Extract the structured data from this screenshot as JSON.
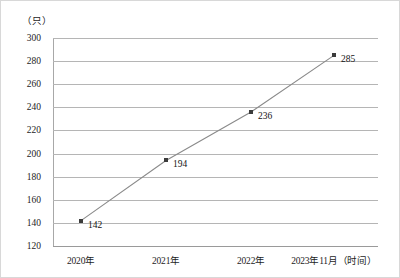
{
  "chart_data": {
    "type": "line",
    "title": "",
    "subtitle": "",
    "xlabel": "时间",
    "ylabel": "只",
    "y_unit_caption": "（只）",
    "x_axis_caption": "（时间）",
    "categories": [
      "2020年",
      "2021年",
      "2022年",
      "2023年11月"
    ],
    "x_tick_labels": [
      "2020年",
      "2021年",
      "2022年",
      "2023年11月（时间）"
    ],
    "values": [
      142,
      194,
      236,
      285
    ],
    "point_labels": [
      "142",
      "194",
      "236",
      "285"
    ],
    "series": [
      {
        "name": "",
        "values": [
          142,
          194,
          236,
          285
        ]
      }
    ],
    "ylim": [
      120,
      300
    ],
    "y_tick_step": 20,
    "y_tick_labels": [
      "300",
      "280",
      "260",
      "240",
      "220",
      "200",
      "180",
      "160",
      "140",
      "120"
    ],
    "y_ticks": [
      300,
      280,
      260,
      240,
      220,
      200,
      180,
      160,
      140,
      120
    ],
    "grid": true,
    "grid_axis": "y",
    "legend": false,
    "legend_position": "none",
    "marker": "square",
    "colors": {
      "line": "#8a8a8a",
      "marker": "#3b3b3b",
      "gridline": "#b5b5b5",
      "axis": "#9a9a9a",
      "text": "#1d1d1d",
      "background": "#ffffff",
      "border": "#d8d8d8"
    }
  }
}
